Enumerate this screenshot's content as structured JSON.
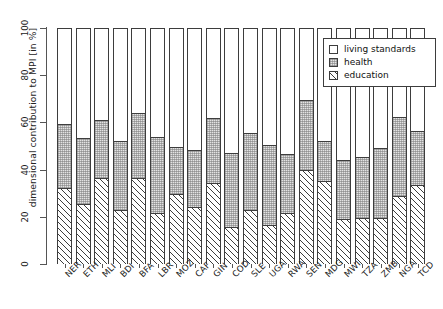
{
  "chart_data": {
    "type": "bar",
    "stacked": true,
    "percent_stacked": true,
    "title": "",
    "xlabel": "",
    "ylabel": "dimensional contribution to MPI [in %]",
    "ylim": [
      0,
      100
    ],
    "yticks": [
      0,
      20,
      40,
      60,
      80,
      100
    ],
    "grid": false,
    "legend_position": "top-right",
    "legend": [
      "living standards",
      "health",
      "education"
    ],
    "series_order_bottom_to_top": [
      "education",
      "health",
      "living standards"
    ],
    "categories": [
      "NER",
      "ETH",
      "MLI",
      "BDI",
      "BFA",
      "LBR",
      "MOZ",
      "CAF",
      "GIN",
      "COD",
      "SLE",
      "UGA",
      "RWA",
      "SEN",
      "MDG",
      "MWI",
      "TZA",
      "ZMB",
      "NGA",
      "TCD"
    ],
    "series": [
      {
        "name": "education",
        "values": [
          32.0,
          25.5,
          36.5,
          23.0,
          36.5,
          21.5,
          29.5,
          24.0,
          34.5,
          15.5,
          23.0,
          16.5,
          21.5,
          40.0,
          35.0,
          19.0,
          19.5,
          19.5,
          29.0,
          33.5
        ]
      },
      {
        "name": "health",
        "values": [
          27.5,
          28.0,
          24.5,
          29.0,
          27.5,
          32.5,
          20.0,
          24.5,
          27.5,
          31.5,
          32.5,
          34.0,
          25.0,
          29.5,
          17.0,
          25.0,
          26.0,
          29.5,
          33.5,
          23.0
        ]
      },
      {
        "name": "living standards",
        "values": [
          40.0,
          46.5,
          39.0,
          48.0,
          36.0,
          46.0,
          50.5,
          51.5,
          38.0,
          53.0,
          44.5,
          49.5,
          53.5,
          30.5,
          48.0,
          56.0,
          54.5,
          51.0,
          37.5,
          43.5
        ]
      }
    ],
    "cumulative_tops": {
      "education": [
        32.0,
        25.5,
        36.5,
        23.0,
        36.5,
        21.5,
        29.5,
        24.0,
        34.5,
        15.5,
        23.0,
        16.5,
        21.5,
        40.0,
        35.0,
        19.0,
        19.5,
        19.5,
        29.0,
        33.5
      ],
      "health": [
        59.5,
        53.5,
        61.0,
        52.0,
        64.0,
        54.0,
        49.5,
        48.5,
        62.0,
        47.0,
        55.5,
        50.5,
        46.5,
        69.5,
        52.0,
        44.0,
        45.5,
        49.0,
        62.5,
        56.5
      ],
      "living standards": [
        100,
        100,
        100,
        100,
        100,
        100,
        100,
        100,
        100,
        100,
        100,
        100,
        100,
        100,
        100,
        100,
        100,
        100,
        100,
        100
      ]
    }
  },
  "legend": {
    "items": [
      {
        "label": "living standards",
        "key": "empty-square"
      },
      {
        "label": "health",
        "key": "stippled-square"
      },
      {
        "label": "education",
        "key": "hatched-square"
      }
    ]
  },
  "axis": {
    "ylabel": "dimensional contribution to MPI [in %]",
    "ytick_labels": [
      "0",
      "20",
      "40",
      "60",
      "80",
      "100"
    ]
  }
}
